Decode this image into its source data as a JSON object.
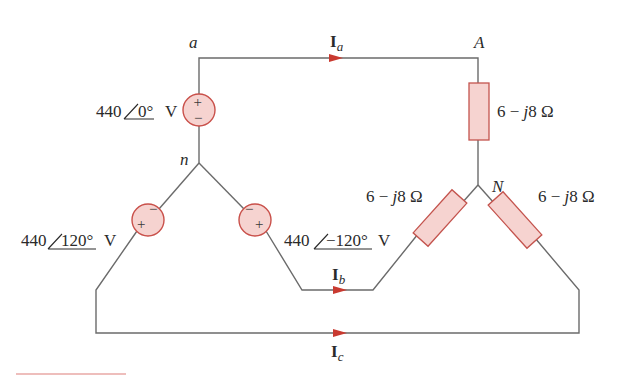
{
  "diagram": {
    "type": "three-phase wye-wye circuit",
    "nodes": {
      "a": "a",
      "n": "n",
      "A": "A",
      "N": "N"
    },
    "sources": [
      {
        "id": "Va",
        "magnitude": "440",
        "angle": "0°",
        "unit": "V",
        "polarity_top": "+",
        "polarity_bottom": "−"
      },
      {
        "id": "Vc",
        "magnitude": "440",
        "angle": "120°",
        "unit": "V",
        "polarity_top": "−",
        "polarity_bottom": "+"
      },
      {
        "id": "Vb",
        "magnitude": "440",
        "angle": "−120°",
        "unit": "V",
        "polarity_top": "−",
        "polarity_bottom": "+"
      }
    ],
    "loads": [
      {
        "id": "ZA",
        "value": "6 − ",
        "j": "j",
        "rest": "8 Ω"
      },
      {
        "id": "ZB",
        "value": "6 − ",
        "j": "j",
        "rest": "8 Ω"
      },
      {
        "id": "ZC",
        "value": "6 − ",
        "j": "j",
        "rest": "8 Ω"
      }
    ],
    "currents": [
      {
        "id": "Ia",
        "symbol": "I",
        "subscript": "a"
      },
      {
        "id": "Ib",
        "symbol": "I",
        "subscript": "b"
      },
      {
        "id": "Ic",
        "symbol": "I",
        "subscript": "c"
      }
    ],
    "colors": {
      "wire": "#6b6b6b",
      "component_fill": "#f6d3d0",
      "component_stroke": "#c9504a",
      "arrow": "#c93a30",
      "text": "#2a2a2a"
    }
  }
}
